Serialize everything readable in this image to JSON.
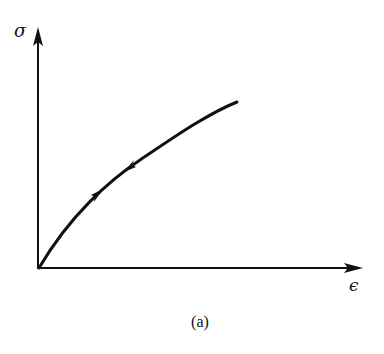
{
  "figure": {
    "y_axis_label": "σ",
    "x_axis_label": "ϵ",
    "caption": "(a)",
    "line_color": "#111111",
    "background": "#ffffff"
  },
  "diagram": {
    "type": "stress-strain curve",
    "elements": [
      {
        "kind": "axis",
        "name": "stress axis",
        "label": "σ",
        "direction": "vertical"
      },
      {
        "kind": "axis",
        "name": "strain axis",
        "label": "ϵ",
        "direction": "horizontal"
      },
      {
        "kind": "curve",
        "name": "loading/unloading path",
        "shape": "concave down, monotonically increasing from origin"
      },
      {
        "kind": "arrow",
        "name": "loading direction",
        "direction": "up along curve"
      },
      {
        "kind": "arrow",
        "name": "unloading direction",
        "direction": "down along curve"
      }
    ]
  }
}
